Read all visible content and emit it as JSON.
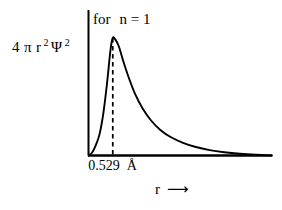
{
  "chart_data": {
    "type": "line",
    "title": "",
    "annotation": "for  n = 1",
    "annotation_prefix": "for",
    "annotation_expr": "n = 1",
    "ylabel_parts": {
      "coefficient": "4",
      "pi": "π",
      "r": "r",
      "r_exp": "2",
      "psi": "Ψ",
      "psi_exp": "2"
    },
    "ylabel": "4 π r2 Ψ2",
    "xlabel": "r",
    "xlabel_arrow": "⟶",
    "tick_value": "0.529",
    "tick_unit": "Å",
    "xticks": [
      "0.529 Å"
    ],
    "grid": false,
    "legend": "none",
    "axis_color": "#000000",
    "curve_color": "#000000",
    "marker_line_style": "dashed",
    "xlim": [
      0,
      4.0
    ],
    "ylim": [
      0,
      1.08
    ],
    "peak_x": 0.529,
    "peak_y": 1.0,
    "x": [
      0.0,
      0.08,
      0.16,
      0.24,
      0.32,
      0.4,
      0.48,
      0.529,
      0.58,
      0.66,
      0.76,
      0.88,
      1.02,
      1.18,
      1.36,
      1.56,
      1.8,
      2.06,
      2.34,
      2.64,
      2.96,
      3.3,
      3.65,
      4.0
    ],
    "y": [
      0.0,
      0.026,
      0.089,
      0.18,
      0.35,
      0.6,
      0.9,
      1.0,
      0.99,
      0.93,
      0.8,
      0.66,
      0.52,
      0.4,
      0.3,
      0.22,
      0.155,
      0.108,
      0.072,
      0.046,
      0.028,
      0.015,
      0.006,
      0.0
    ]
  }
}
